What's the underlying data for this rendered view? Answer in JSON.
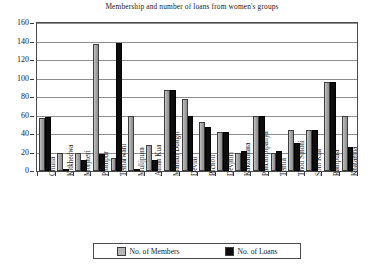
{
  "chart_data": {
    "type": "bar",
    "title": "Membership and number of loans from women's groups",
    "xlabel": "",
    "ylabel": "",
    "ylim": [
      0,
      160
    ],
    "yticks": [
      0,
      20,
      40,
      60,
      80,
      100,
      120,
      140,
      160
    ],
    "grid": true,
    "legend_position": "bottom",
    "categories": [
      "Chulia",
      "Kitkhedwa",
      "Morjheri",
      "Pithnpur",
      "Temarwani",
      "Mulijpura",
      "Aman Kua",
      "Mahudi Dungri",
      "Devlai",
      "Bicholi",
      "Devjhiri",
      "Kakradhara",
      "Panchlipipaliya",
      "Temla",
      "Thod Sindhi",
      "Som Kua",
      "Rampura",
      "Khatamba"
    ],
    "series": [
      {
        "name": "No. of Members",
        "color": "#a8a8a8",
        "values": [
          57,
          20,
          20,
          137,
          14,
          60,
          28,
          88,
          78,
          53,
          42,
          20,
          60,
          20,
          44,
          44,
          96,
          60
        ]
      },
      {
        "name": "No. of Loans",
        "color": "#0d0d0d",
        "values": [
          58,
          2,
          12,
          18,
          138,
          2,
          12,
          88,
          60,
          48,
          42,
          22,
          60,
          22,
          30,
          44,
          96,
          26
        ]
      }
    ]
  },
  "legend": {
    "entries": [
      {
        "label": "No. of Members",
        "swatch": "members"
      },
      {
        "label": "No. of Loans",
        "swatch": "loans"
      }
    ]
  }
}
